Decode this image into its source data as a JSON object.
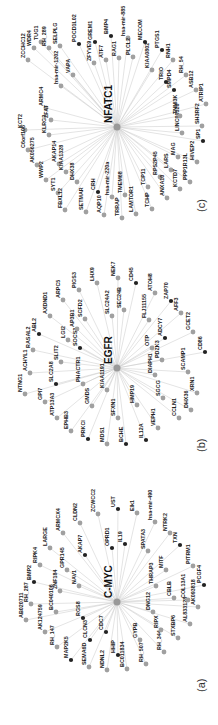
{
  "figure": {
    "orientation": "rotated-90-ccw",
    "colors": {
      "edge": "#c8c8c8",
      "gray_node": "#a0a0a0",
      "black_node": "#222222",
      "hub_node": "#999999"
    },
    "panels": [
      {
        "id": "c",
        "panel_label": "(c)",
        "hub": "NFATC1",
        "hub_pos": [
          117,
          127
        ],
        "label_pos": [
          205,
          212
        ],
        "nodes": [
          {
            "label": "ZCCHC12",
            "x": 28,
            "y": 60,
            "black": false
          },
          {
            "label": "WDR4",
            "x": 34,
            "y": 48,
            "black": false
          },
          {
            "label": "TUG1",
            "x": 41,
            "y": 42,
            "black": false
          },
          {
            "label": "RH_289",
            "x": 49,
            "y": 48,
            "black": false
          },
          {
            "label": "SELPLG",
            "x": 60,
            "y": 46,
            "black": false
          },
          {
            "label": "POCD1L02",
            "x": 79,
            "y": 44,
            "black": true
          },
          {
            "label": "GREM1",
            "x": 95,
            "y": 42,
            "black": true
          },
          {
            "label": "BMP4",
            "x": 111,
            "y": 36,
            "black": true
          },
          {
            "label": "hsa-mir-885",
            "x": 128,
            "y": 38,
            "black": false
          },
          {
            "label": "PLCL2",
            "x": 133,
            "y": 57,
            "black": false
          },
          {
            "label": "RAG1",
            "x": 119,
            "y": 58,
            "black": false
          },
          {
            "label": "ATF7",
            "x": 106,
            "y": 60,
            "black": false
          },
          {
            "label": "ZFYVE9",
            "x": 94,
            "y": 63,
            "black": false
          },
          {
            "label": "VAPA",
            "x": 73,
            "y": 75,
            "black": false
          },
          {
            "label": "hsa-mir-1202",
            "x": 61,
            "y": 86,
            "black": false
          },
          {
            "label": "ARMC4",
            "x": 46,
            "y": 108,
            "black": false
          },
          {
            "label": "KCT2",
            "x": 25,
            "y": 130,
            "black": false
          },
          {
            "label": "ZFAT",
            "x": 51,
            "y": 120,
            "black": false
          },
          {
            "label": "KLRG2",
            "x": 49,
            "y": 135,
            "black": false
          },
          {
            "label": "C6orf106",
            "x": 28,
            "y": 150,
            "black": false
          },
          {
            "label": "AK056275",
            "x": 37,
            "y": 165,
            "black": false
          },
          {
            "label": "AKAP14",
            "x": 59,
            "y": 164,
            "black": false
          },
          {
            "label": "KIAA1328",
            "x": 66,
            "y": 172,
            "black": false
          },
          {
            "label": "WWP2",
            "x": 46,
            "y": 180,
            "black": false
          },
          {
            "label": "DHX38",
            "x": 77,
            "y": 182,
            "black": false
          },
          {
            "label": "SYT1",
            "x": 58,
            "y": 193,
            "black": false
          },
          {
            "label": "FBXL12",
            "x": 65,
            "y": 210,
            "black": false
          },
          {
            "label": "SETMAR",
            "x": 86,
            "y": 212,
            "black": false
          },
          {
            "label": "CRH",
            "x": 98,
            "y": 192,
            "black": true
          },
          {
            "label": "AQP10",
            "x": 104,
            "y": 215,
            "black": false
          },
          {
            "label": "hsa-mir-220a",
            "x": 112,
            "y": 197,
            "black": false
          },
          {
            "label": "TRRAP",
            "x": 122,
            "y": 218,
            "black": false
          },
          {
            "label": "TMEM68",
            "x": 125,
            "y": 195,
            "black": false
          },
          {
            "label": "LAMTOR1",
            "x": 136,
            "y": 214,
            "black": false
          },
          {
            "label": "TCP11",
            "x": 148,
            "y": 187,
            "black": false
          },
          {
            "label": "TCHP",
            "x": 152,
            "y": 209,
            "black": false
          },
          {
            "label": "RPS2P45",
            "x": 160,
            "y": 177,
            "black": false
          },
          {
            "label": "ANXA10",
            "x": 167,
            "y": 198,
            "black": false
          },
          {
            "label": "LARS",
            "x": 171,
            "y": 170,
            "black": false
          },
          {
            "label": "KCTD7",
            "x": 180,
            "y": 189,
            "black": false
          },
          {
            "label": "MAG",
            "x": 178,
            "y": 157,
            "black": false
          },
          {
            "label": "PPP1R13L",
            "x": 190,
            "y": 182,
            "black": false
          },
          {
            "label": "HIVEP2",
            "x": 197,
            "y": 162,
            "black": false
          },
          {
            "label": "SP1",
            "x": 203,
            "y": 141,
            "black": true
          },
          {
            "label": "LINC00526",
            "x": 182,
            "y": 133,
            "black": false
          },
          {
            "label": "SH3RF2",
            "x": 202,
            "y": 126,
            "black": false
          },
          {
            "label": "TNNI3K",
            "x": 180,
            "y": 116,
            "black": false
          },
          {
            "label": "ATRIP1",
            "x": 206,
            "y": 104,
            "black": false
          },
          {
            "label": "SMPD4",
            "x": 174,
            "y": 90,
            "black": true
          },
          {
            "label": "ASB12",
            "x": 196,
            "y": 90,
            "black": false
          },
          {
            "label": "TRIO",
            "x": 166,
            "y": 82,
            "black": true
          },
          {
            "label": "RH_54",
            "x": 186,
            "y": 75,
            "black": false
          },
          {
            "label": "KIAA0802",
            "x": 152,
            "y": 70,
            "black": false
          },
          {
            "label": "RNH1",
            "x": 173,
            "y": 60,
            "black": false
          },
          {
            "label": "PTGS1",
            "x": 162,
            "y": 50,
            "black": true
          },
          {
            "label": "MECOM",
            "x": 145,
            "y": 42,
            "black": true
          }
        ]
      },
      {
        "id": "b",
        "panel_label": "(b)",
        "hub": "EGFR",
        "hub_pos": [
          117,
          368
        ],
        "label_pos": [
          205,
          452
        ],
        "nodes": [
          {
            "label": "LHX9",
            "x": 97,
            "y": 283,
            "black": false
          },
          {
            "label": "PIGS3",
            "x": 79,
            "y": 290,
            "black": false
          },
          {
            "label": "ARPC5",
            "x": 63,
            "y": 300,
            "black": false
          },
          {
            "label": "AXDND1",
            "x": 50,
            "y": 316,
            "black": false
          },
          {
            "label": "ABL2",
            "x": 39,
            "y": 334,
            "black": true
          },
          {
            "label": "RASAL2",
            "x": 33,
            "y": 350,
            "black": false
          },
          {
            "label": "ACHYL1",
            "x": 30,
            "y": 373,
            "black": false
          },
          {
            "label": "NTNG1",
            "x": 25,
            "y": 394,
            "black": false
          },
          {
            "label": "GPI7",
            "x": 45,
            "y": 402,
            "black": false
          },
          {
            "label": "ATP13A3",
            "x": 57,
            "y": 418,
            "black": false
          },
          {
            "label": "EPHB3",
            "x": 71,
            "y": 431,
            "black": false
          },
          {
            "label": "PRKCI",
            "x": 88,
            "y": 439,
            "black": true
          },
          {
            "label": "MDS1",
            "x": 107,
            "y": 444,
            "black": false
          },
          {
            "label": "BCHE",
            "x": 126,
            "y": 444,
            "black": true
          },
          {
            "label": "IL12A",
            "x": 146,
            "y": 440,
            "black": true
          },
          {
            "label": "VEPH1",
            "x": 158,
            "y": 428,
            "black": false
          },
          {
            "label": "CCLN1",
            "x": 179,
            "y": 418,
            "black": false
          },
          {
            "label": "DHX36",
            "x": 191,
            "y": 410,
            "black": false
          },
          {
            "label": "XRN1",
            "x": 197,
            "y": 393,
            "black": false
          },
          {
            "label": "CD86",
            "x": 205,
            "y": 352,
            "black": true
          },
          {
            "label": "GCET2",
            "x": 193,
            "y": 332,
            "black": false
          },
          {
            "label": "AFF3",
            "x": 181,
            "y": 313,
            "black": false
          },
          {
            "label": "ZAP70",
            "x": 171,
            "y": 301,
            "black": true
          },
          {
            "label": "ATOH8",
            "x": 155,
            "y": 293,
            "black": false
          },
          {
            "label": "CD45",
            "x": 136,
            "y": 283,
            "black": true
          },
          {
            "label": "NEK7",
            "x": 118,
            "y": 278,
            "black": false
          },
          {
            "label": "SEC24B",
            "x": 124,
            "y": 310,
            "black": false
          },
          {
            "label": "SLC24A2",
            "x": 112,
            "y": 316,
            "black": false
          },
          {
            "label": "FLJ11155",
            "x": 149,
            "y": 320,
            "black": false
          },
          {
            "label": "ADCY7",
            "x": 165,
            "y": 338,
            "black": true
          },
          {
            "label": "OTP",
            "x": 152,
            "y": 348,
            "black": false
          },
          {
            "label": "PDZK3",
            "x": 162,
            "y": 360,
            "black": false
          },
          {
            "label": "SCAMP1",
            "x": 188,
            "y": 372,
            "black": false
          },
          {
            "label": "DIAPH1",
            "x": 155,
            "y": 375,
            "black": false
          },
          {
            "label": "SGCG",
            "x": 163,
            "y": 398,
            "black": false
          },
          {
            "label": "HMP19",
            "x": 137,
            "y": 405,
            "black": false
          },
          {
            "label": "SFXN1",
            "x": 118,
            "y": 418,
            "black": false
          },
          {
            "label": "KIAA1191",
            "x": 107,
            "y": 390,
            "black": false
          },
          {
            "label": "GMDS",
            "x": 92,
            "y": 406,
            "black": false
          },
          {
            "label": "PHACTR1",
            "x": 83,
            "y": 384,
            "black": false
          },
          {
            "label": "SLC2A8",
            "x": 56,
            "y": 384,
            "black": true
          },
          {
            "label": "SLIT2",
            "x": 61,
            "y": 362,
            "black": false
          },
          {
            "label": "SOCS3",
            "x": 80,
            "y": 348,
            "black": true
          },
          {
            "label": "LGI2",
            "x": 68,
            "y": 340,
            "black": false
          },
          {
            "label": "AP3B1",
            "x": 77,
            "y": 329,
            "black": false
          },
          {
            "label": "SCFD2",
            "x": 85,
            "y": 319,
            "black": false
          }
        ]
      },
      {
        "id": "a",
        "panel_label": "(a)",
        "hub": "C-MYC",
        "hub_pos": [
          117,
          602
        ],
        "label_pos": [
          205,
          692
        ],
        "nodes": [
          {
            "label": "ZCWCC2",
            "x": 98,
            "y": 514,
            "black": false
          },
          {
            "label": "CLDN2",
            "x": 80,
            "y": 523,
            "black": false
          },
          {
            "label": "ARMCX4",
            "x": 63,
            "y": 533,
            "black": false
          },
          {
            "label": "LARGE",
            "x": 50,
            "y": 548,
            "black": false
          },
          {
            "label": "RIPK4",
            "x": 40,
            "y": 565,
            "black": false
          },
          {
            "label": "BMP2",
            "x": 34,
            "y": 582,
            "black": true
          },
          {
            "label": "RH_287",
            "x": 31,
            "y": 604,
            "black": false
          },
          {
            "label": "AB020711",
            "x": 26,
            "y": 620,
            "black": false
          },
          {
            "label": "AK124759",
            "x": 45,
            "y": 632,
            "black": false
          },
          {
            "label": "RH_147",
            "x": 57,
            "y": 647,
            "black": false
          },
          {
            "label": "MAP2K5",
            "x": 71,
            "y": 660,
            "black": true
          },
          {
            "label": "SEMA6D",
            "x": 89,
            "y": 667,
            "black": false
          },
          {
            "label": "NDNL2",
            "x": 107,
            "y": 670,
            "black": false
          },
          {
            "label": "BC011834",
            "x": 127,
            "y": 669,
            "black": false
          },
          {
            "label": "RH_507",
            "x": 146,
            "y": 664,
            "black": false
          },
          {
            "label": "RH_344",
            "x": 164,
            "y": 652,
            "black": false
          },
          {
            "label": "STXBP6",
            "x": 178,
            "y": 638,
            "black": false
          },
          {
            "label": "AL833128",
            "x": 190,
            "y": 624,
            "black": false
          },
          {
            "label": "AK093818",
            "x": 198,
            "y": 607,
            "black": false
          },
          {
            "label": "PCGF4",
            "x": 204,
            "y": 585,
            "black": true
          },
          {
            "label": "PITRM1",
            "x": 193,
            "y": 566,
            "black": false
          },
          {
            "label": "TXN",
            "x": 180,
            "y": 545,
            "black": true
          },
          {
            "label": "NTRK2",
            "x": 170,
            "y": 533,
            "black": false
          },
          {
            "label": "hsa-mir-490",
            "x": 155,
            "y": 522,
            "black": false
          },
          {
            "label": "Elk1",
            "x": 137,
            "y": 513,
            "black": false
          },
          {
            "label": "UST",
            "x": 118,
            "y": 509,
            "black": true
          },
          {
            "label": "OPRD1",
            "x": 112,
            "y": 548,
            "black": true
          },
          {
            "label": "IL19",
            "x": 125,
            "y": 544,
            "black": true
          },
          {
            "label": "SPATA3",
            "x": 148,
            "y": 551,
            "black": false
          },
          {
            "label": "MITF",
            "x": 166,
            "y": 570,
            "black": false
          },
          {
            "label": "THRAP3",
            "x": 156,
            "y": 586,
            "black": false
          },
          {
            "label": "CBLB",
            "x": 174,
            "y": 598,
            "black": false
          },
          {
            "label": "COL13A1",
            "x": 188,
            "y": 600,
            "black": false
          },
          {
            "label": "DNG12",
            "x": 153,
            "y": 612,
            "black": false
          },
          {
            "label": "RIPX",
            "x": 161,
            "y": 630,
            "black": false
          },
          {
            "label": "GYPB",
            "x": 140,
            "y": 640,
            "black": false
          },
          {
            "label": "HHIP",
            "x": 118,
            "y": 655,
            "black": true
          },
          {
            "label": "CDC7",
            "x": 106,
            "y": 632,
            "black": true
          },
          {
            "label": "CLCN3",
            "x": 90,
            "y": 640,
            "black": true
          },
          {
            "label": "RGS8",
            "x": 83,
            "y": 618,
            "black": true
          },
          {
            "label": "BC040106",
            "x": 56,
            "y": 612,
            "black": false
          },
          {
            "label": "ZNF184",
            "x": 60,
            "y": 591,
            "black": false
          },
          {
            "label": "NAV1",
            "x": 79,
            "y": 586,
            "black": false
          },
          {
            "label": "GPR145",
            "x": 67,
            "y": 570,
            "black": false
          },
          {
            "label": "AKAP7",
            "x": 85,
            "y": 555,
            "black": true
          }
        ]
      }
    ]
  }
}
